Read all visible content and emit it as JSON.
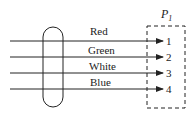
{
  "diagram": {
    "connector": {
      "label": "P",
      "subscript": "1"
    },
    "wires": [
      {
        "label": "Red",
        "pin": "1"
      },
      {
        "label": "Green",
        "pin": "2"
      },
      {
        "label": "White",
        "pin": "3"
      },
      {
        "label": "Blue",
        "pin": "4"
      }
    ],
    "colors": {
      "stroke": "#222222",
      "background": "#ffffff"
    }
  }
}
